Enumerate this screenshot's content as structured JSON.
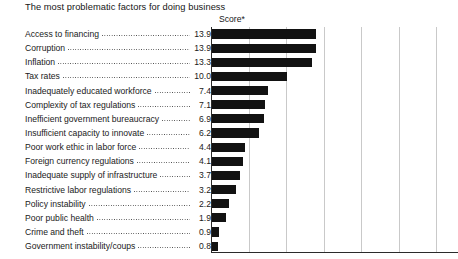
{
  "chart_data": {
    "type": "bar",
    "orientation": "horizontal",
    "title": "The most problematic factors for doing business",
    "axis_caption": "Score*",
    "xlabel": "",
    "ylabel": "",
    "xlim": [
      0,
      32.9
    ],
    "grid": true,
    "gridline_values": [
      5,
      10,
      15,
      20,
      25,
      30
    ],
    "legend": null,
    "categories": [
      "Access to financing",
      "Corruption",
      "Inflation",
      "Tax rates",
      "Inadequately educated workforce",
      "Complexity of tax regulations",
      "Inefficient government bureaucracy",
      "Insufficient capacity to innovate",
      "Poor work ethic in labor force",
      "Foreign currency regulations",
      "Inadequate supply of infrastructure",
      "Restrictive labor regulations",
      "Policy instability",
      "Poor public health",
      "Crime and theft",
      "Government instability/coups"
    ],
    "values": [
      13.9,
      13.9,
      13.3,
      10.0,
      7.4,
      7.1,
      6.9,
      6.2,
      4.4,
      4.1,
      3.7,
      3.2,
      2.2,
      1.9,
      0.9,
      0.8
    ],
    "value_labels": [
      "13.9",
      "13.9",
      "13.3",
      "10.0",
      "7.4",
      "7.1",
      "6.9",
      "6.2",
      "4.4",
      "4.1",
      "3.7",
      "3.2",
      "2.2",
      "1.9",
      "0.9",
      "0.8"
    ],
    "colors": {
      "bar": "#121212",
      "gridline": "#c9c9c9",
      "axis": "#2b2b2b",
      "text": "#1a1a1a",
      "background": "#ffffff"
    }
  }
}
